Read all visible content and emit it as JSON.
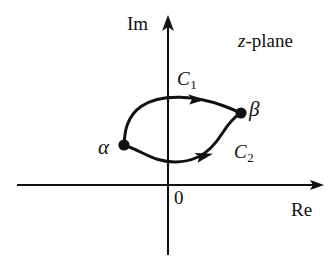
{
  "figure": {
    "background_color": "#ffffff",
    "ink_color": "#111111",
    "width": 336,
    "height": 261
  },
  "axes": {
    "imaginary_label": "Im",
    "real_label": "Re",
    "origin_label": "0",
    "plane_label_italic": "z",
    "plane_label_rest": "-plane",
    "vertical_axis": {
      "x": 168,
      "y_top": 18,
      "y_bottom": 255
    },
    "horizontal_axis": {
      "y": 185,
      "x_left": 17,
      "x_right": 322
    }
  },
  "points": [
    {
      "name": "alpha",
      "label": "α",
      "x": 124,
      "y": 145,
      "radius": 5.5,
      "filled": true
    },
    {
      "name": "beta",
      "label": "β",
      "x": 241,
      "y": 113,
      "radius": 5.5,
      "filled": true
    }
  ],
  "contours": [
    {
      "name": "C1",
      "label_base": "C",
      "label_sub": "1",
      "description": "upper path from alpha to beta, counterclockwise direction arrow pointing right",
      "direction": "alpha-to-beta",
      "arrow_at": {
        "x": 197,
        "y": 99
      }
    },
    {
      "name": "C2",
      "label_base": "C",
      "label_sub": "2",
      "description": "lower path from alpha to beta, direction arrow pointing right",
      "direction": "alpha-to-beta",
      "arrow_at": {
        "x": 205,
        "y": 156
      }
    }
  ]
}
